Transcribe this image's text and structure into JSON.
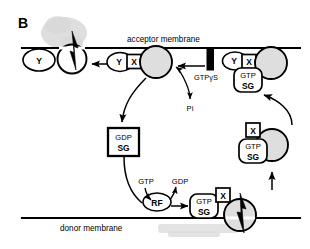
{
  "figure": {
    "panel_label": "B",
    "acceptor_membrane_label": "acceptor membrane",
    "donor_membrane_label": "donor membrane"
  },
  "nodes": {
    "y_left": "Y",
    "y_mid": "Y",
    "y_right": "Y",
    "x_mid": "X",
    "x_right": "X",
    "x_free": "X",
    "x_donor": "X",
    "rf": "RF"
  },
  "nucleotide_complexes": {
    "acceptor_bound": {
      "top": "GTP",
      "bottom": "SG"
    },
    "free_vesicle": {
      "top": "GTP",
      "bottom": "SG"
    },
    "cytosolic": {
      "top": "GDP",
      "bottom": "SG"
    },
    "donor_bound": {
      "top": "GTP",
      "bottom": "SG"
    }
  },
  "annotations": {
    "gtpys": "GTPγS",
    "pi": "Pi",
    "gtp_in": "GTP",
    "gdp_out": "GDP"
  },
  "colors": {
    "ink": "#000000",
    "vesicle_fill": "#dedede",
    "background": "#ffffff",
    "artifact_gray": "#d8d8d8"
  }
}
